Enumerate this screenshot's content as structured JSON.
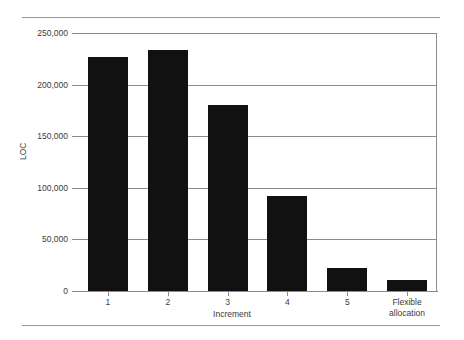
{
  "chart_data": {
    "type": "bar",
    "title": "",
    "subtitle": "",
    "xlabel": "Increment",
    "ylabel": "LOC",
    "categories": [
      "1",
      "2",
      "3",
      "4",
      "5",
      "Flexible allocation"
    ],
    "values": [
      227000,
      234000,
      180000,
      92000,
      22000,
      11000
    ],
    "series": [
      {
        "name": "LOC",
        "values": [
          227000,
          234000,
          180000,
          92000,
          22000,
          11000
        ]
      }
    ],
    "ylim": [
      0,
      250000
    ],
    "ytick_labels": [
      "250,000",
      "200,000",
      "150,000",
      "100,000",
      "50,000",
      "0"
    ],
    "ytick_values": [
      250000,
      200000,
      150000,
      100000,
      50000,
      0
    ],
    "xtick_labels": [
      "1",
      "2",
      "3",
      "4",
      "5",
      "Flexible allocation"
    ],
    "grid": true,
    "legend": false,
    "legend_position": "none",
    "bar_color": "#111111",
    "axis_color": "#8c8c8c",
    "text_color": "#3a3a3a",
    "background_color": "#ffffff"
  },
  "figure": {
    "top_rule": "",
    "bottom_rule": ""
  }
}
